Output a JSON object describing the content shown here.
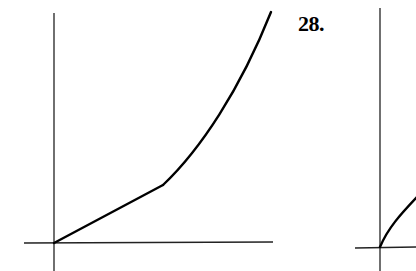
{
  "problem_label": "28.",
  "colors": {
    "axis": "#222222",
    "curve": "#000000",
    "background": "#ffffff"
  },
  "graphs": [
    {
      "id": "left-graph",
      "description": "Piecewise graph: straight line from origin to a kink, then concave-up increasing curve",
      "axes": {
        "origin": [
          54,
          243
        ],
        "x_axis": [
          24,
          273
        ],
        "y_axis": [
          13,
          271
        ]
      },
      "segments": [
        {
          "type": "line",
          "from": [
            54,
            243
          ],
          "to": [
            163,
            185
          ]
        },
        {
          "type": "curve",
          "from": [
            163,
            185
          ],
          "to": [
            271,
            12
          ],
          "shape": "concave-up"
        }
      ]
    },
    {
      "id": "right-graph",
      "description": "Partially visible graph: increasing concave-down curve from origin",
      "axes": {
        "origin": [
          380,
          247
        ],
        "x_axis": [
          355,
          416
        ],
        "y_axis": [
          8,
          271
        ]
      },
      "segments": [
        {
          "type": "curve",
          "from": [
            380,
            247
          ],
          "to": [
            416,
            198
          ],
          "shape": "concave-down"
        }
      ]
    }
  ]
}
